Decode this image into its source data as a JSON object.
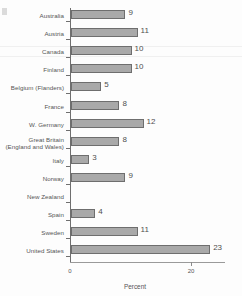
{
  "chart_data": {
    "type": "bar",
    "orientation": "horizontal",
    "title": "",
    "xlabel": "Percent",
    "ylabel": "",
    "xlim": [
      0,
      25
    ],
    "xticks": [
      0,
      20
    ],
    "xtick_labels": [
      "0",
      "20"
    ],
    "grid": false,
    "legend": null,
    "categories": [
      "Australia",
      "Austria",
      "Canada",
      "Finland",
      "Belgium (Flanders)",
      "France",
      "W. Germany",
      "Great Britain (England and Wales)",
      "Italy",
      "Norway",
      "New Zealand",
      "Spain",
      "Sweden",
      "United States"
    ],
    "values": [
      9,
      11,
      10,
      10,
      5,
      8,
      12,
      8,
      3,
      9,
      null,
      4,
      11,
      23
    ],
    "value_labels": [
      "9",
      "11",
      "10",
      "10",
      "5",
      "8",
      "12",
      "8",
      "3",
      "9",
      "",
      "4",
      "11",
      "23"
    ],
    "bars": [
      {
        "category": "Australia",
        "label_lines": [
          "Australia"
        ],
        "value": 9,
        "value_label": "9"
      },
      {
        "category": "Austria",
        "label_lines": [
          "Austria"
        ],
        "value": 11,
        "value_label": "11"
      },
      {
        "category": "Canada",
        "label_lines": [
          "Canada"
        ],
        "value": 10,
        "value_label": "10"
      },
      {
        "category": "Finland",
        "label_lines": [
          "Finland"
        ],
        "value": 10,
        "value_label": "10"
      },
      {
        "category": "Belgium (Flanders)",
        "label_lines": [
          "Belgium (Flanders)"
        ],
        "value": 5,
        "value_label": "5"
      },
      {
        "category": "France",
        "label_lines": [
          "France"
        ],
        "value": 8,
        "value_label": "8"
      },
      {
        "category": "W. Germany",
        "label_lines": [
          "W. Germany"
        ],
        "value": 12,
        "value_label": "12"
      },
      {
        "category": "Great Britain",
        "label_lines": [
          "Great Britain",
          "(England and Wales)"
        ],
        "value": 8,
        "value_label": "8"
      },
      {
        "category": "Italy",
        "label_lines": [
          "Italy"
        ],
        "value": 3,
        "value_label": "3"
      },
      {
        "category": "Norway",
        "label_lines": [
          "Norway"
        ],
        "value": 9,
        "value_label": "9"
      },
      {
        "category": "New Zealand",
        "label_lines": [
          "New Zealand"
        ],
        "value": null,
        "value_label": ""
      },
      {
        "category": "Spain",
        "label_lines": [
          "Spain"
        ],
        "value": 4,
        "value_label": "4"
      },
      {
        "category": "Sweden",
        "label_lines": [
          "Sweden"
        ],
        "value": 11,
        "value_label": "11"
      },
      {
        "category": "United States",
        "label_lines": [
          "United States"
        ],
        "value": 23,
        "value_label": "23"
      }
    ],
    "colors": {
      "bar_fill": "#a9a9a9",
      "bar_border": "#6e6e6e",
      "axis": "#6f6f6f",
      "text": "#555555",
      "background": "#fdfdfd"
    }
  }
}
